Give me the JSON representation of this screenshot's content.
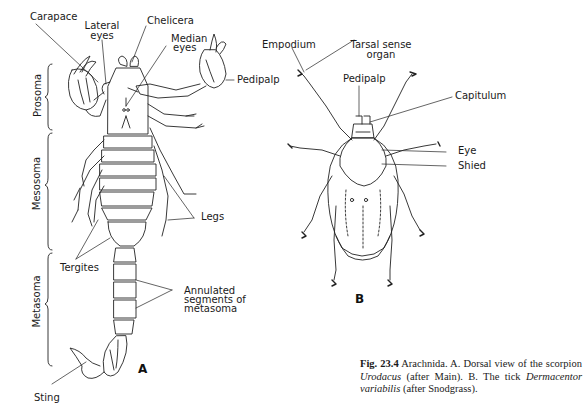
{
  "figure": {
    "panels": [
      {
        "id": "A",
        "letter": "A",
        "subject": "scorpion",
        "labels": {
          "carapace": "Carapace",
          "lateral_eyes_1": "Lateral",
          "lateral_eyes_2": "eyes",
          "chelicera": "Chelicera",
          "median_eyes_1": "Median",
          "median_eyes_2": "eyes",
          "pedipalp": "Pedipalp",
          "legs": "Legs",
          "tergites": "Tergites",
          "annulated_1": "Annulated",
          "annulated_2": "segments of",
          "annulated_3": "metasoma",
          "sting": "Sting"
        },
        "regions": {
          "prosoma": "Prosoma",
          "mesosoma": "Mesosoma",
          "metasoma": "Metasoma"
        }
      },
      {
        "id": "B",
        "letter": "B",
        "subject": "tick",
        "labels": {
          "empodium": "Empodium",
          "tarsal_1": "Tarsal sense",
          "tarsal_2": "organ",
          "pedipalp": "Pedipalp",
          "capitulum": "Capitulum",
          "eye": "Eye",
          "shield": "Shied"
        }
      }
    ],
    "caption": {
      "number": "Fig. 23.4",
      "part1": " Arachnida. A. Dorsal view of the scorpion ",
      "genus": "Urodacus",
      "part2": " (after Main). B. The tick ",
      "species": "Dermacentor variabilis",
      "part3": " (after Snodgrass)."
    }
  }
}
